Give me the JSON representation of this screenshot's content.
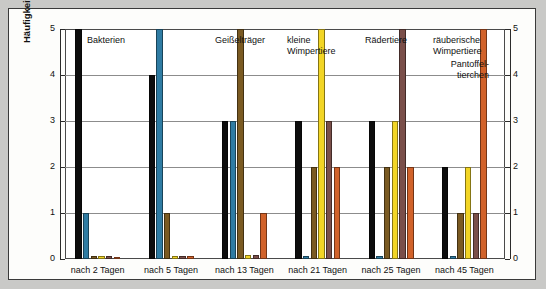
{
  "chart_data": {
    "type": "bar",
    "title": "",
    "xlabel": "",
    "ylabel": "Häufigkeit",
    "ylim": [
      0,
      5
    ],
    "yticks": [
      "0",
      "1",
      "2",
      "3",
      "4",
      "5"
    ],
    "grid": true,
    "legend_position": "in-plot-annotations",
    "categories": [
      "nach 2 Tagen",
      "nach 5 Tagen",
      "nach 13 Tagen",
      "nach 21 Tagen",
      "nach 25 Tagen",
      "nach 45 Tagen"
    ],
    "series": [
      {
        "name": "Bakterien",
        "color": "#0d0d0d",
        "values": [
          5,
          4,
          3,
          3,
          3,
          2
        ]
      },
      {
        "name": "Geißelträger",
        "color": "#2f7ca3",
        "values": [
          1,
          5,
          3,
          0.06,
          0.06,
          0.06
        ]
      },
      {
        "name": "kleine Wimpertiere",
        "color": "#7a5a22",
        "values": [
          0.06,
          1,
          5,
          2,
          2,
          1
        ]
      },
      {
        "name": "Rädertiere",
        "color": "#f2d525",
        "values": [
          0.06,
          0.06,
          0.08,
          5,
          3,
          2
        ]
      },
      {
        "name": "räuberische Wimpertiere",
        "color": "#7a4f4a",
        "values": [
          0.06,
          0.06,
          0.08,
          3,
          5,
          1
        ]
      },
      {
        "name": "Pantoffeltierchen",
        "color": "#d1622a",
        "values": [
          0.05,
          0.06,
          1,
          2,
          2,
          5
        ]
      }
    ],
    "annotations": [
      {
        "text": "Bakterien",
        "series": "Bakterien"
      },
      {
        "text": "Geißelträger",
        "series": "Geißelträger"
      },
      {
        "text": "kleine\nWimpertiere",
        "series": "kleine Wimpertiere"
      },
      {
        "text": "Rädertiere",
        "series": "Rädertiere"
      },
      {
        "text": "räuberische\nWimpertiere",
        "series": "räuberische Wimpertiere"
      },
      {
        "text": "Pantoffel-\ntierchen",
        "series": "Pantoffeltierchen"
      }
    ]
  },
  "axis": {
    "y_title": "Häufigkeit",
    "tick_0": "0",
    "tick_1": "1",
    "tick_2": "2",
    "tick_3": "3",
    "tick_4": "4",
    "tick_5": "5"
  },
  "axis_right": {
    "tick_0": "0",
    "tick_1": "1",
    "tick_2": "2",
    "tick_3": "3",
    "tick_4": "4",
    "tick_5": "5"
  },
  "groups": {
    "g0": "nach 2 Tagen",
    "g1": "nach 5 Tagen",
    "g2": "nach 13 Tagen",
    "g3": "nach 21 Tagen",
    "g4": "nach 25 Tagen",
    "g5": "nach 45 Tagen"
  },
  "labels": {
    "bakterien": "Bakterien",
    "geisseltraeger": "Geißelträger",
    "kleine_wimpertiere": "kleine\nWimpertiere",
    "raedertiere": "Rädertiere",
    "raeuberische_wimpertiere": "räuberische\nWimpertiere",
    "pantoffeltierchen": "Pantoffel-\ntierchen"
  }
}
